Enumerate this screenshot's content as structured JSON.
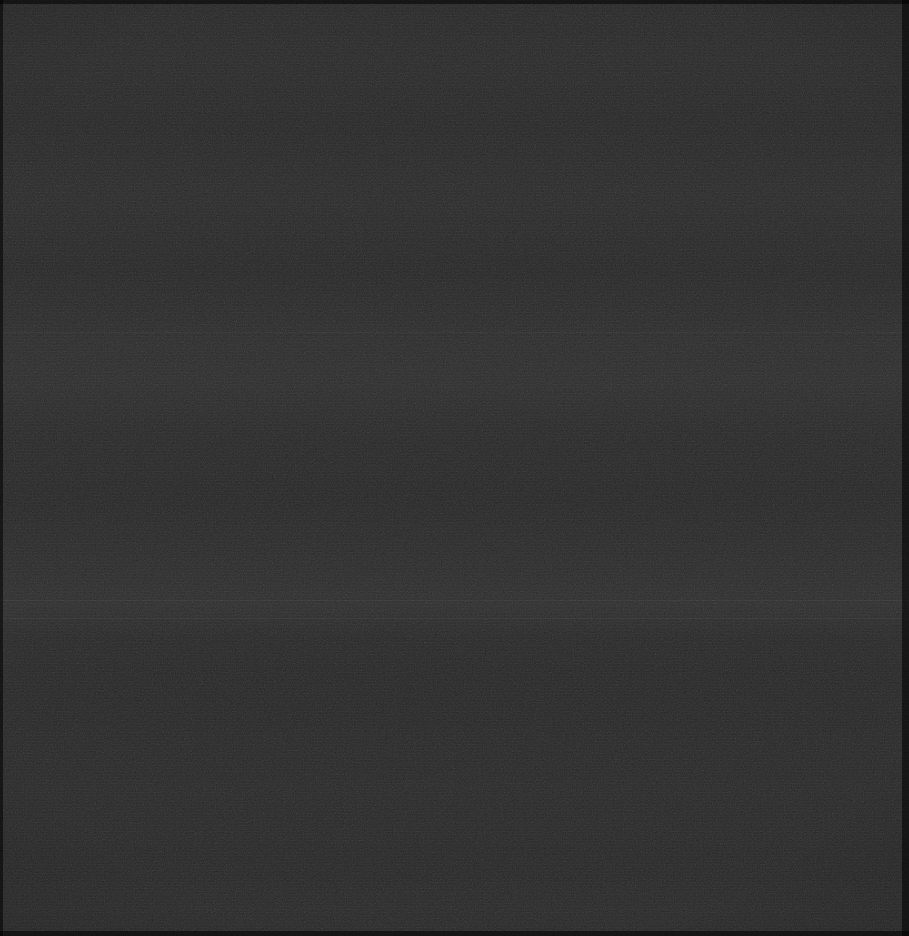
{
  "screen": {
    "width": 909,
    "height": 936,
    "state_label": "blank",
    "description": "Blank black screen capture — no visible user interface content",
    "background_color": "#252525",
    "edge_color": "#000000",
    "visible_text": "",
    "artifacts": {
      "scanline_banding": "horizontal",
      "noise": "compression speckle",
      "edge_border": "scalloped dark border on all four sides"
    },
    "bands": [
      {
        "name": "upper-band",
        "top": 330,
        "height": 60
      },
      {
        "name": "mid-band",
        "top": 570,
        "height": 50
      },
      {
        "name": "lower-band",
        "top": 780,
        "height": 40
      }
    ],
    "hairlines": [
      {
        "name": "hairline-upper",
        "top": 332
      },
      {
        "name": "hairline-mid",
        "top": 600
      },
      {
        "name": "hairline-lower",
        "top": 618
      }
    ]
  }
}
